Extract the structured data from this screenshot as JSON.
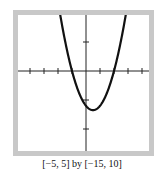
{
  "chart_data": {
    "type": "line",
    "title": "",
    "xlabel": "",
    "ylabel": "",
    "xlim": [
      -5,
      5
    ],
    "ylim": [
      -15,
      10
    ],
    "x_tick_step": 1,
    "y_tick_step": 5,
    "grid": false,
    "legend": null,
    "series": [
      {
        "name": "parabola",
        "equation_estimate": "y = 3x^2 - 3x - 6",
        "x": [
          -2,
          -1.5,
          -1,
          -0.5,
          0,
          0.5,
          1,
          1.5,
          2,
          2.5,
          3
        ],
        "y": [
          12,
          5.25,
          0,
          -3.75,
          -6,
          -6.75,
          -6,
          -3.75,
          0,
          5.25,
          12
        ]
      }
    ],
    "annotations": [
      "[−5, 5] by [−15, 10]"
    ]
  },
  "caption": "[−5, 5] by [−15, 10]",
  "colors": {
    "curve": "#111111",
    "axes": "#222222",
    "frame": "#c0c0c0"
  }
}
